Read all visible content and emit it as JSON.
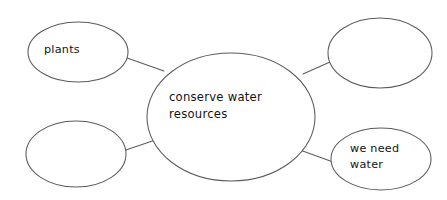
{
  "diagram": {
    "type": "concept-map",
    "title": "conserve water resources",
    "background_color": "#ffffff",
    "stroke_color": "#5b5b5f",
    "text_color": "#131313",
    "canvas": {
      "width": 447,
      "height": 200
    },
    "center_node": {
      "id": "center",
      "label": "conserve water\nresources",
      "cx": 231,
      "cy": 117,
      "rx": 84,
      "ry": 64,
      "empty": false
    },
    "satellite_nodes": [
      {
        "id": "top-left",
        "label": "plants",
        "cx": 78,
        "cy": 52,
        "rx": 50,
        "ry": 30,
        "empty": false
      },
      {
        "id": "top-right",
        "label": "",
        "cx": 380,
        "cy": 53,
        "rx": 52,
        "ry": 35,
        "empty": true
      },
      {
        "id": "bottom-left",
        "label": "",
        "cx": 76,
        "cy": 154,
        "rx": 50,
        "ry": 33,
        "empty": true
      },
      {
        "id": "bottom-right",
        "label": "we need\nwater",
        "cx": 381,
        "cy": 159,
        "rx": 50,
        "ry": 31,
        "empty": false
      }
    ],
    "connectors": [
      {
        "id": "center-to-top-left",
        "x1": 127,
        "y1": 58,
        "x2": 164,
        "y2": 71
      },
      {
        "id": "center-to-top-right",
        "x1": 303,
        "y1": 74,
        "x2": 330,
        "y2": 62
      },
      {
        "id": "center-to-bottom-left",
        "x1": 126,
        "y1": 150,
        "x2": 164,
        "y2": 137
      },
      {
        "id": "center-to-bottom-right",
        "x1": 300,
        "y1": 150,
        "x2": 333,
        "y2": 162
      }
    ]
  }
}
